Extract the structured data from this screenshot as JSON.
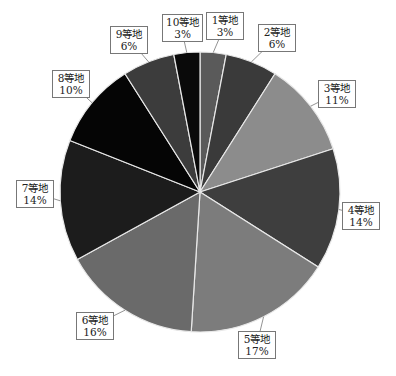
{
  "chart_data": {
    "type": "pie",
    "title": "",
    "start_angle_deg": 0,
    "direction": "clockwise",
    "categories": [
      "1等地",
      "2等地",
      "3等地",
      "4等地",
      "5等地",
      "6等地",
      "7等地",
      "8等地",
      "9等地",
      "10等地"
    ],
    "values": [
      3,
      6,
      11,
      14,
      17,
      16,
      14,
      10,
      6,
      3
    ],
    "value_labels": [
      "3%",
      "6%",
      "11%",
      "14%",
      "17%",
      "16%",
      "14%",
      "10%",
      "6%",
      "3%"
    ],
    "colors": [
      "#5a5a5a",
      "#3a3a3a",
      "#8c8c8c",
      "#3e3e3e",
      "#7c7c7c",
      "#6a6a6a",
      "#1c1c1c",
      "#050505",
      "#3c3c3c",
      "#0a0a0a"
    ],
    "slice_border_color": "#e8e8e8",
    "legend": "none",
    "labels": "callouts"
  },
  "callouts": [
    {
      "name": "1等地",
      "pct": "3%",
      "x": 206,
      "y": 12,
      "w": 38
    },
    {
      "name": "2等地",
      "pct": "6%",
      "x": 258,
      "y": 24,
      "w": 38
    },
    {
      "name": "3等地",
      "pct": "11%",
      "x": 318,
      "y": 80,
      "w": 38
    },
    {
      "name": "4等地",
      "pct": "14%",
      "x": 342,
      "y": 202,
      "w": 38
    },
    {
      "name": "5等地",
      "pct": "17%",
      "x": 238,
      "y": 331,
      "w": 38
    },
    {
      "name": "6等地",
      "pct": "16%",
      "x": 76,
      "y": 312,
      "w": 38
    },
    {
      "name": "7等地",
      "pct": "14%",
      "x": 16,
      "y": 180,
      "w": 38
    },
    {
      "name": "8等地",
      "pct": "10%",
      "x": 52,
      "y": 70,
      "w": 38
    },
    {
      "name": "9等地",
      "pct": "6%",
      "x": 110,
      "y": 26,
      "w": 38
    },
    {
      "name": "10等地",
      "pct": "3%",
      "x": 162,
      "y": 14,
      "w": 38
    }
  ]
}
